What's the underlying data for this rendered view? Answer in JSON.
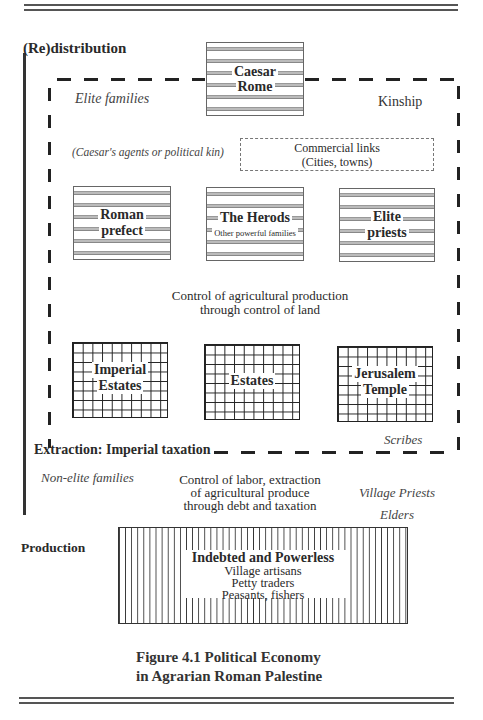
{
  "figure": {
    "caption_line1": "Figure 4.1 Political Economy",
    "caption_line2": "in Agrarian Roman Palestine"
  },
  "axis": {
    "top_label": "(Re)distribution",
    "bottom_label": "Production"
  },
  "elite_zone": {
    "label_left": "Elite families",
    "label_right": "Kinship",
    "agents_note": "(Caesar's agents or political kin)",
    "commercial_links": {
      "line1": "Commercial links",
      "line2": "(Cities, towns)"
    },
    "caesar": {
      "line1": "Caesar",
      "line2": "Rome"
    },
    "tier1": [
      {
        "line1": "Roman",
        "line2": "prefect"
      },
      {
        "line1": "The Herods",
        "line2": "Other powerful families"
      },
      {
        "line1": "Elite",
        "line2": "priests"
      }
    ],
    "land_control": {
      "line1": "Control of agricultural production",
      "line2": "through control of land"
    },
    "tier2": [
      {
        "line1": "Imperial",
        "line2": "Estates"
      },
      {
        "line1": "Estates",
        "line2": ""
      },
      {
        "line1": "Jerusalem",
        "line2": "Temple"
      }
    ],
    "scribes": "Scribes",
    "extraction": "Extraction: Imperial taxation"
  },
  "non_elite_zone": {
    "label_left": "Non-elite families",
    "labor_control": {
      "line1": "Control of labor, extraction",
      "line2": "of agricultural produce",
      "line3": "through debt and taxation"
    },
    "village_priests": "Village Priests",
    "elders": "Elders",
    "powerless": {
      "title": "Indebted and Powerless",
      "items": [
        "Village artisans",
        "Petty traders",
        "Peasants, fishers"
      ]
    }
  }
}
